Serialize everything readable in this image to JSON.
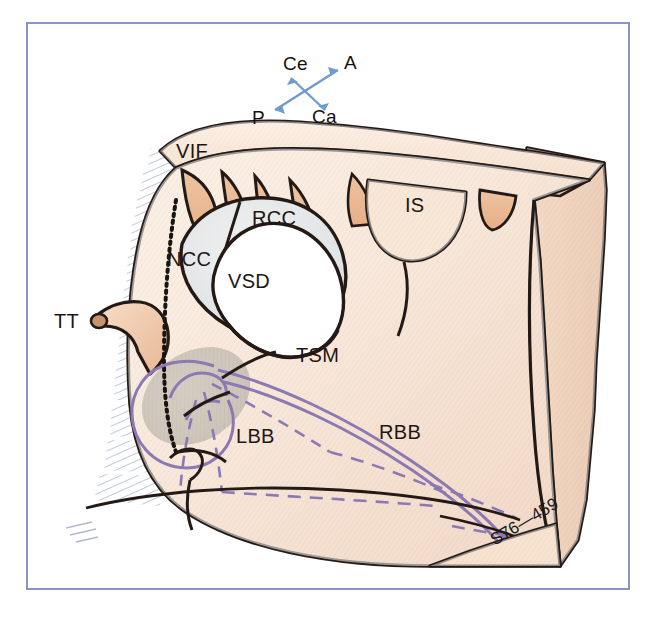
{
  "figure": {
    "kind": "anatomical-illustration",
    "frame_color": "#8e95c4",
    "background": "#ffffff"
  },
  "compass": {
    "name": "orientation-compass",
    "labels": {
      "cephalad": "Ce",
      "anterior": "A",
      "posterior": "P",
      "caudad": "Ca"
    },
    "arrow_color": "#6f9ccb"
  },
  "labels": [
    {
      "id": "vif",
      "text": "VIF",
      "x": 176,
      "y": 140
    },
    {
      "id": "rcc",
      "text": "RCC",
      "x": 252,
      "y": 207
    },
    {
      "id": "ncc",
      "text": "NCC",
      "x": 167,
      "y": 248
    },
    {
      "id": "vsd",
      "text": "VSD",
      "x": 228,
      "y": 270
    },
    {
      "id": "is",
      "text": "IS",
      "x": 405,
      "y": 194
    },
    {
      "id": "tt",
      "text": "TT",
      "x": 54,
      "y": 310
    },
    {
      "id": "tsm",
      "text": "TSM",
      "x": 296,
      "y": 344
    },
    {
      "id": "lbb",
      "text": "LBB",
      "x": 236,
      "y": 425
    },
    {
      "id": "rbb",
      "text": "RBB",
      "x": 379,
      "y": 421
    }
  ],
  "signature": {
    "text": "S76—459"
  },
  "caption": {
    "text": ""
  },
  "palette": {
    "myocardium_light": "#f6d9bf",
    "myocardium_mid": "#efc3a1",
    "myocardium_dark": "#e2ab86",
    "myocardium_deep": "#d79a74",
    "cusp_grey": "#e4e5e6",
    "defect_white": "#ffffff",
    "shadow_olive": "#ab9d89",
    "outline": "#231a16",
    "conduction_purple": "#8b79b4",
    "hatch_blue": "#b9c0d8"
  }
}
